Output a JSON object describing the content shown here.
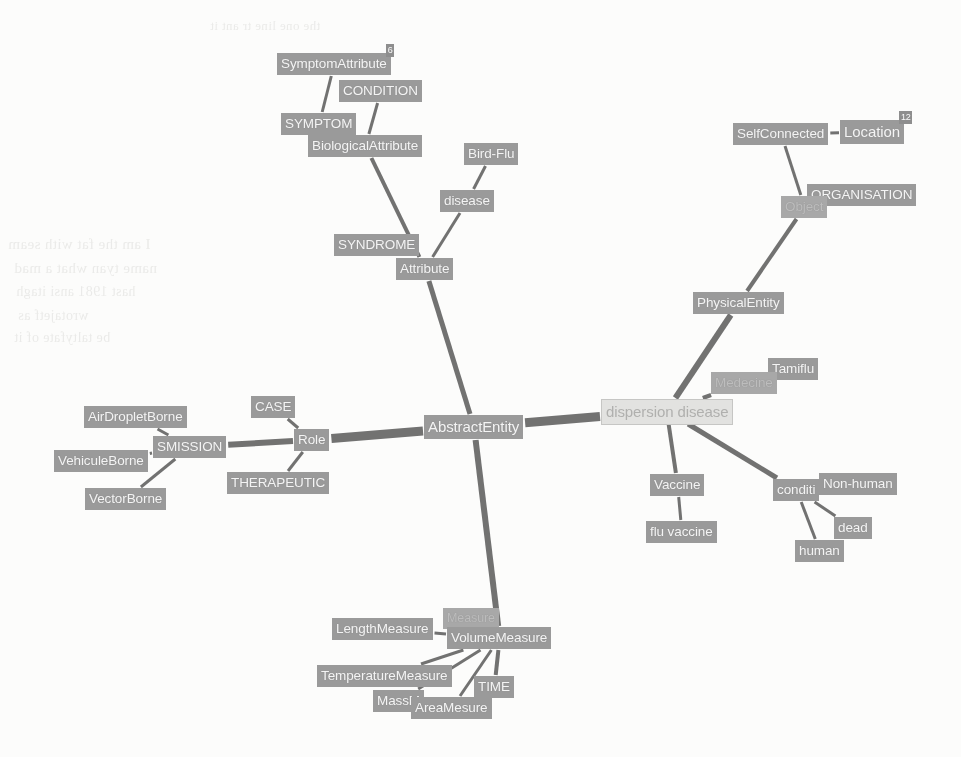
{
  "app": {
    "title": "Ontology Graph Visualization",
    "center_node": "AbstractEntity",
    "selected_node": "dispersion disease",
    "colors": {
      "node_fill": "#9a9a9a",
      "node_text": "#f4f4f4",
      "selected_fill": "#e2e2e0",
      "selected_text": "#b0b0ae",
      "edge": "#5a5a5a",
      "background": "#fcfcfb"
    }
  },
  "nodes": [
    {
      "id": "symptomattribute",
      "label": "SymptomAttribute",
      "x": 277,
      "y": 53,
      "size": "normal",
      "state": "normal",
      "badge": "6"
    },
    {
      "id": "condition",
      "label": "CONDITION",
      "x": 339,
      "y": 80,
      "size": "normal",
      "state": "normal"
    },
    {
      "id": "symptom",
      "label": "SYMPTOM",
      "x": 281,
      "y": 113,
      "size": "normal",
      "state": "normal"
    },
    {
      "id": "biologicalattribute",
      "label": "BiologicalAttribute",
      "x": 308,
      "y": 135,
      "size": "normal",
      "state": "normal"
    },
    {
      "id": "birdflu",
      "label": "Bird-Flu",
      "x": 464,
      "y": 143,
      "size": "normal",
      "state": "normal"
    },
    {
      "id": "disease",
      "label": "disease",
      "x": 440,
      "y": 190,
      "size": "normal",
      "state": "normal"
    },
    {
      "id": "syndrome",
      "label": "SYNDROME",
      "x": 334,
      "y": 234,
      "size": "normal",
      "state": "normal"
    },
    {
      "id": "attribute",
      "label": "Attribute",
      "x": 396,
      "y": 258,
      "size": "normal",
      "state": "normal"
    },
    {
      "id": "selfconnected",
      "label": "SelfConnected",
      "x": 733,
      "y": 123,
      "size": "normal",
      "state": "normal"
    },
    {
      "id": "location",
      "label": "Location",
      "x": 840,
      "y": 120,
      "size": "big",
      "state": "normal",
      "badge": "12"
    },
    {
      "id": "organisation",
      "label": "ORGANISATION",
      "x": 807,
      "y": 184,
      "size": "normal",
      "state": "normal"
    },
    {
      "id": "object",
      "label": "Object",
      "x": 781,
      "y": 196,
      "size": "normal",
      "state": "faded"
    },
    {
      "id": "physicalentity",
      "label": "PhysicalEntity",
      "x": 693,
      "y": 292,
      "size": "normal",
      "state": "normal"
    },
    {
      "id": "tamiflu",
      "label": "Tamiflu",
      "x": 768,
      "y": 358,
      "size": "normal",
      "state": "normal"
    },
    {
      "id": "medecine",
      "label": "Medecine",
      "x": 711,
      "y": 372,
      "size": "normal",
      "state": "faded"
    },
    {
      "id": "dispersiondisease",
      "label": "dispersion disease",
      "x": 601,
      "y": 399,
      "size": "big",
      "state": "selected"
    },
    {
      "id": "vaccine",
      "label": "Vaccine",
      "x": 650,
      "y": 474,
      "size": "normal",
      "state": "normal"
    },
    {
      "id": "fluvaccine",
      "label": "flu vaccine",
      "x": 646,
      "y": 521,
      "size": "normal",
      "state": "normal"
    },
    {
      "id": "condition2",
      "label": "conditi",
      "x": 773,
      "y": 479,
      "size": "normal",
      "state": "normal"
    },
    {
      "id": "nonhuman",
      "label": "Non-human",
      "x": 819,
      "y": 473,
      "size": "normal",
      "state": "normal"
    },
    {
      "id": "dead",
      "label": "dead",
      "x": 834,
      "y": 517,
      "size": "normal",
      "state": "normal"
    },
    {
      "id": "human",
      "label": "human",
      "x": 795,
      "y": 540,
      "size": "normal",
      "state": "normal"
    },
    {
      "id": "abstractentity",
      "label": "AbstractEntity",
      "x": 424,
      "y": 415,
      "size": "big",
      "state": "normal"
    },
    {
      "id": "case",
      "label": "CASE",
      "x": 251,
      "y": 396,
      "size": "normal",
      "state": "normal"
    },
    {
      "id": "role",
      "label": "Role",
      "x": 294,
      "y": 429,
      "size": "normal",
      "state": "normal"
    },
    {
      "id": "therapeutic",
      "label": "THERAPEUTIC",
      "x": 227,
      "y": 472,
      "size": "normal",
      "state": "normal"
    },
    {
      "id": "transmission",
      "label": "SMISSION",
      "x": 153,
      "y": 436,
      "size": "normal",
      "state": "normal"
    },
    {
      "id": "airdropletborne",
      "label": "AirDropletBorne",
      "x": 84,
      "y": 406,
      "size": "normal",
      "state": "normal"
    },
    {
      "id": "vehiculeborne",
      "label": "VehiculeBorne",
      "x": 54,
      "y": 450,
      "size": "normal",
      "state": "normal"
    },
    {
      "id": "vectorborne",
      "label": "VectorBorne",
      "x": 85,
      "y": 488,
      "size": "normal",
      "state": "normal"
    },
    {
      "id": "lengthmeasure",
      "label": "LengthMeasure",
      "x": 332,
      "y": 618,
      "size": "normal",
      "state": "normal"
    },
    {
      "id": "hiddenmeasure",
      "label": "Measure",
      "x": 443,
      "y": 608,
      "size": "small",
      "state": "faded"
    },
    {
      "id": "volumemeasure",
      "label": "VolumeMeasure",
      "x": 447,
      "y": 627,
      "size": "normal",
      "state": "normal"
    },
    {
      "id": "temperaturemeasure",
      "label": "TemperatureMeasure",
      "x": 317,
      "y": 665,
      "size": "normal",
      "state": "normal"
    },
    {
      "id": "time",
      "label": "TIME",
      "x": 474,
      "y": 676,
      "size": "normal",
      "state": "normal"
    },
    {
      "id": "massmeasure",
      "label": "MassM",
      "x": 373,
      "y": 690,
      "size": "normal",
      "state": "normal"
    },
    {
      "id": "areamesure",
      "label": "AreaMesure",
      "x": 411,
      "y": 697,
      "size": "normal",
      "state": "normal"
    }
  ],
  "edges": [
    {
      "from": "abstractentity",
      "to": "dispersiondisease",
      "width": 9
    },
    {
      "from": "abstractentity",
      "to": "role",
      "width": 9
    },
    {
      "from": "abstractentity",
      "to": "attribute",
      "width": 5
    },
    {
      "from": "abstractentity",
      "to": "volumemeasure",
      "width": 6
    },
    {
      "from": "attribute",
      "to": "biologicalattribute",
      "width": 4
    },
    {
      "from": "attribute",
      "to": "syndrome",
      "width": 3
    },
    {
      "from": "attribute",
      "to": "disease",
      "width": 3
    },
    {
      "from": "disease",
      "to": "birdflu",
      "width": 3
    },
    {
      "from": "biologicalattribute",
      "to": "symptom",
      "width": 3
    },
    {
      "from": "biologicalattribute",
      "to": "condition",
      "width": 3
    },
    {
      "from": "symptom",
      "to": "symptomattribute",
      "width": 3
    },
    {
      "from": "dispersiondisease",
      "to": "physicalentity",
      "width": 6
    },
    {
      "from": "physicalentity",
      "to": "object",
      "width": 4
    },
    {
      "from": "object",
      "to": "selfconnected",
      "width": 3
    },
    {
      "from": "object",
      "to": "organisation",
      "width": 3
    },
    {
      "from": "selfconnected",
      "to": "location",
      "width": 3
    },
    {
      "from": "dispersiondisease",
      "to": "medecine",
      "width": 4
    },
    {
      "from": "medecine",
      "to": "tamiflu",
      "width": 3
    },
    {
      "from": "dispersiondisease",
      "to": "vaccine",
      "width": 4
    },
    {
      "from": "vaccine",
      "to": "fluvaccine",
      "width": 3
    },
    {
      "from": "dispersiondisease",
      "to": "condition2",
      "width": 5
    },
    {
      "from": "condition2",
      "to": "human",
      "width": 3
    },
    {
      "from": "condition2",
      "to": "dead",
      "width": 3
    },
    {
      "from": "condition2",
      "to": "nonhuman",
      "width": 3
    },
    {
      "from": "role",
      "to": "transmission",
      "width": 6
    },
    {
      "from": "role",
      "to": "case",
      "width": 3
    },
    {
      "from": "role",
      "to": "therapeutic",
      "width": 3
    },
    {
      "from": "transmission",
      "to": "airdropletborne",
      "width": 3
    },
    {
      "from": "transmission",
      "to": "vehiculeborne",
      "width": 3
    },
    {
      "from": "transmission",
      "to": "vectorborne",
      "width": 3
    },
    {
      "from": "volumemeasure",
      "to": "lengthmeasure",
      "width": 3
    },
    {
      "from": "volumemeasure",
      "to": "temperaturemeasure",
      "width": 3
    },
    {
      "from": "volumemeasure",
      "to": "time",
      "width": 4
    },
    {
      "from": "volumemeasure",
      "to": "massmeasure",
      "width": 3
    },
    {
      "from": "volumemeasure",
      "to": "areamesure",
      "width": 3
    }
  ],
  "watermarks": [
    {
      "text": "I am the fat with seam",
      "x": 8,
      "y": 236,
      "size": 15
    },
    {
      "text": "name tyan what a mad",
      "x": 14,
      "y": 260,
      "size": 15
    },
    {
      "text": "hast 1981 ansi   itagh",
      "x": 16,
      "y": 284,
      "size": 14
    },
    {
      "text": "wrotajetf as",
      "x": 18,
      "y": 308,
      "size": 14
    },
    {
      "text": "be taltyfate of it",
      "x": 14,
      "y": 330,
      "size": 14
    },
    {
      "text": "the one line tr ant it",
      "x": 210,
      "y": 18,
      "size": 13
    }
  ]
}
